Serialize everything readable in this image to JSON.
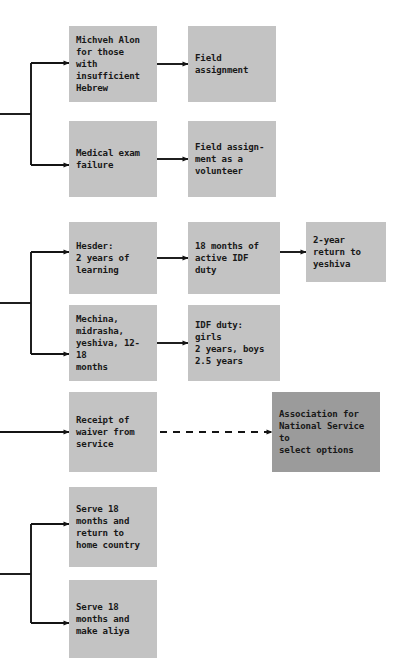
{
  "diagram": {
    "canvas": {
      "width": 399,
      "height": 670
    },
    "colors": {
      "node_fill": "#c3c3c3",
      "node_fill_dark": "#9b9b9b",
      "edge": "#141414",
      "text": "#181818",
      "background": "#ffffff"
    },
    "nodes": [
      {
        "id": "michveh-alon",
        "label": "Michveh Alon\nfor those with\ninsufficient\nHebrew",
        "x": 69,
        "y": 26,
        "w": 88,
        "h": 76,
        "shade": "light"
      },
      {
        "id": "field-assignment",
        "label": "Field\nassignment",
        "x": 188,
        "y": 26,
        "w": 88,
        "h": 76,
        "shade": "light"
      },
      {
        "id": "medical-exam-failure",
        "label": "Medical exam\nfailure",
        "x": 69,
        "y": 121,
        "w": 88,
        "h": 76,
        "shade": "light"
      },
      {
        "id": "field-assignment-volunteer",
        "label": "Field assign-\nment as a\nvolunteer",
        "x": 188,
        "y": 121,
        "w": 88,
        "h": 76,
        "shade": "light"
      },
      {
        "id": "hesder",
        "label": "Hesder:\n2 years of\nlearning",
        "x": 69,
        "y": 222,
        "w": 88,
        "h": 72,
        "shade": "light"
      },
      {
        "id": "active-idf-duty",
        "label": "18 months of\nactive IDF duty",
        "x": 188,
        "y": 222,
        "w": 92,
        "h": 72,
        "shade": "light"
      },
      {
        "id": "return-to-yeshiva",
        "label": "2-year\nreturn to\nyeshiva",
        "x": 306,
        "y": 222,
        "w": 80,
        "h": 60,
        "shade": "light"
      },
      {
        "id": "mechina-midrasha",
        "label": "Mechina,\nmidrasha,\nyeshiva, 12-18\nmonths",
        "x": 69,
        "y": 305,
        "w": 88,
        "h": 76,
        "shade": "light"
      },
      {
        "id": "idf-duty-girls-boys",
        "label": "IDF duty: girls\n2 years, boys\n2.5 years",
        "x": 188,
        "y": 305,
        "w": 92,
        "h": 76,
        "shade": "light"
      },
      {
        "id": "receipt-of-waiver",
        "label": "Receipt of\nwaiver from\nservice",
        "x": 69,
        "y": 392,
        "w": 88,
        "h": 80,
        "shade": "light"
      },
      {
        "id": "association-national-service",
        "label": "Association for\nNational Service to\nselect options",
        "x": 272,
        "y": 392,
        "w": 108,
        "h": 80,
        "shade": "dark"
      },
      {
        "id": "serve-return-home",
        "label": "Serve 18\nmonths and\nreturn to\nhome country",
        "x": 69,
        "y": 487,
        "w": 88,
        "h": 80,
        "shade": "light"
      },
      {
        "id": "serve-make-aliya",
        "label": "Serve 18\nmonths and\nmake aliya",
        "x": 69,
        "y": 580,
        "w": 88,
        "h": 78,
        "shade": "light"
      }
    ],
    "edges": [
      {
        "id": "bracket-top",
        "style": "solid",
        "kind": "bracket",
        "stem_x1": 0,
        "stem_x2": 31,
        "stem_y": 114,
        "spine_x": 31,
        "spine_y1": 63,
        "spine_y2": 165,
        "arrow_x": 69,
        "arrow_ys": [
          63,
          165
        ]
      },
      {
        "id": "bracket-middle",
        "style": "solid",
        "kind": "bracket",
        "stem_x1": 0,
        "stem_x2": 31,
        "stem_y": 303,
        "spine_x": 31,
        "spine_y1": 252,
        "spine_y2": 354,
        "arrow_x": 69,
        "arrow_ys": [
          252,
          354
        ]
      },
      {
        "id": "waiver-inbound",
        "style": "solid",
        "kind": "straight",
        "x1": 0,
        "x2": 69,
        "y": 432
      },
      {
        "id": "bracket-bottom",
        "style": "solid",
        "kind": "bracket",
        "stem_x1": 0,
        "stem_x2": 31,
        "stem_y": 574,
        "spine_x": 31,
        "spine_y1": 524,
        "spine_y2": 623,
        "arrow_x": 69,
        "arrow_ys": [
          524,
          623
        ]
      },
      {
        "id": "michveh-to-field",
        "style": "solid",
        "kind": "straight",
        "x1": 157,
        "x2": 188,
        "y": 64
      },
      {
        "id": "medical-to-volunteer",
        "style": "solid",
        "kind": "straight",
        "x1": 157,
        "x2": 188,
        "y": 159
      },
      {
        "id": "hesder-to-idf",
        "style": "solid",
        "kind": "straight",
        "x1": 157,
        "x2": 188,
        "y": 258
      },
      {
        "id": "idf-to-yeshiva",
        "style": "solid",
        "kind": "straight",
        "x1": 280,
        "x2": 306,
        "y": 252
      },
      {
        "id": "mechina-to-idf-duty",
        "style": "solid",
        "kind": "straight",
        "x1": 157,
        "x2": 188,
        "y": 343
      },
      {
        "id": "waiver-to-association",
        "style": "dashed",
        "kind": "straight",
        "x1": 160,
        "x2": 272,
        "y": 432
      }
    ]
  }
}
